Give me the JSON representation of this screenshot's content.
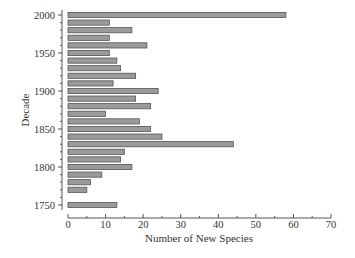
{
  "chart_data": {
    "type": "bar",
    "orientation": "horizontal",
    "title": "",
    "xlabel": "Number of New Species",
    "ylabel": "Decade",
    "xlim": [
      0,
      70
    ],
    "ylim": [
      1750,
      2000
    ],
    "x_ticks": [
      0,
      10,
      20,
      30,
      40,
      50,
      60,
      70
    ],
    "y_ticks": [
      1750,
      1800,
      1850,
      1900,
      1950,
      2000
    ],
    "grid": false,
    "legend": null,
    "categories": [
      1750,
      1770,
      1780,
      1790,
      1800,
      1810,
      1820,
      1830,
      1840,
      1850,
      1860,
      1870,
      1880,
      1890,
      1900,
      1910,
      1920,
      1930,
      1940,
      1950,
      1960,
      1970,
      1980,
      1990,
      2000
    ],
    "values": [
      13,
      5,
      6,
      9,
      17,
      14,
      15,
      44,
      25,
      22,
      19,
      10,
      22,
      18,
      24,
      12,
      18,
      14,
      13,
      11,
      21,
      11,
      17,
      11,
      58
    ],
    "colors": {
      "bar_fill": "#9a9a9a",
      "bar_stroke": "#555555",
      "axis": "#555555"
    }
  }
}
